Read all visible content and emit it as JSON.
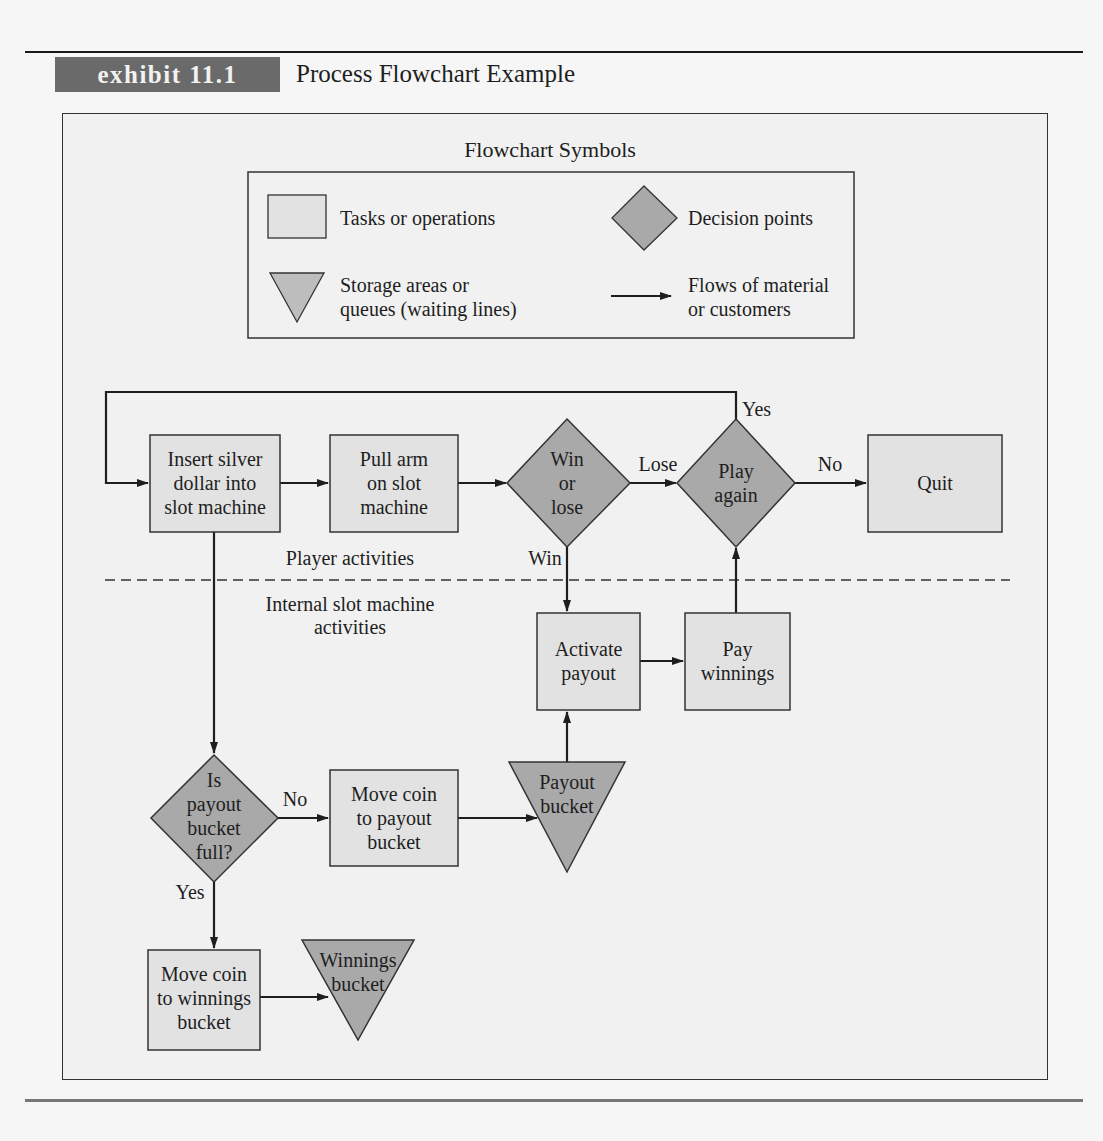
{
  "header": {
    "exhibit_tag": "exhibit 11.1",
    "title": "Process Flowchart Example"
  },
  "legend": {
    "title": "Flowchart Symbols",
    "items": [
      {
        "symbol": "rectangle",
        "label": "Tasks or operations"
      },
      {
        "symbol": "diamond",
        "label": "Decision points"
      },
      {
        "symbol": "inverted-triangle",
        "label_line1": "Storage areas or",
        "label_line2": "queues (waiting lines)"
      },
      {
        "symbol": "arrow",
        "label_line1": "Flows of material",
        "label_line2": "or customers"
      }
    ]
  },
  "swimlanes": {
    "upper": "Player activities",
    "lower_line1": "Internal slot machine",
    "lower_line2": "activities"
  },
  "nodes": {
    "insert": {
      "type": "task",
      "lines": [
        "Insert silver",
        "dollar into",
        "slot machine"
      ]
    },
    "pull": {
      "type": "task",
      "lines": [
        "Pull arm",
        "on slot",
        "machine"
      ]
    },
    "win_or_lose": {
      "type": "decision",
      "lines": [
        "Win",
        "or",
        "lose"
      ]
    },
    "play_again": {
      "type": "decision",
      "lines": [
        "Play",
        "again"
      ]
    },
    "quit": {
      "type": "task",
      "lines": [
        "Quit"
      ]
    },
    "activate_payout": {
      "type": "task",
      "lines": [
        "Activate",
        "payout"
      ]
    },
    "pay_winnings": {
      "type": "task",
      "lines": [
        "Pay",
        "winnings"
      ]
    },
    "payout_bucket": {
      "type": "storage",
      "lines": [
        "Payout",
        "bucket"
      ]
    },
    "is_full": {
      "type": "decision",
      "lines": [
        "Is",
        "payout",
        "bucket",
        "full?"
      ]
    },
    "move_to_payout": {
      "type": "task",
      "lines": [
        "Move coin",
        "to payout",
        "bucket"
      ]
    },
    "move_to_winnings": {
      "type": "task",
      "lines": [
        "Move coin",
        "to winnings",
        "bucket"
      ]
    },
    "winnings_bucket": {
      "type": "storage",
      "lines": [
        "Winnings",
        "bucket"
      ]
    }
  },
  "edge_labels": {
    "lose": "Lose",
    "win": "Win",
    "yes_play": "Yes",
    "no_play": "No",
    "no_full": "No",
    "yes_full": "Yes"
  },
  "colors": {
    "tag_bg": "#6a6a6a",
    "task_fill": "#e2e2e2",
    "decision_fill": "#a9a9a9",
    "storage_fill": "#a9a9a9",
    "stroke": "#2a2a2a",
    "page_bg": "#f6f6f6"
  }
}
